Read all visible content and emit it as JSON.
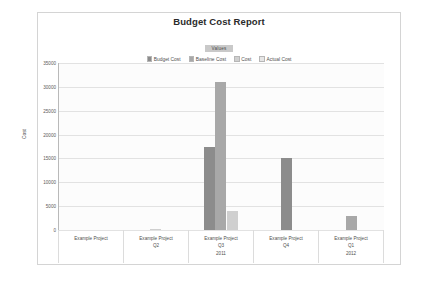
{
  "chart_data": {
    "type": "bar",
    "title": "Budget Cost Report",
    "xlabel": "",
    "ylabel": "Cost",
    "ylim": [
      0,
      35000
    ],
    "yticks": [
      "0",
      "5000",
      "10000",
      "15000",
      "20000",
      "25000",
      "30000",
      "35000"
    ],
    "grid": true,
    "legend_position": "top",
    "legend_header": "Values",
    "categories": [
      {
        "name": "Example Project",
        "quarter": "",
        "year": ""
      },
      {
        "name": "Example Project",
        "quarter": "Q2",
        "year": ""
      },
      {
        "name": "Example Project",
        "quarter": "Q3",
        "year": "2011"
      },
      {
        "name": "Example Project",
        "quarter": "Q4",
        "year": ""
      },
      {
        "name": "Example Project",
        "quarter": "Q1",
        "year": "2012"
      }
    ],
    "series": [
      {
        "name": "Budget Cost",
        "color": "#8c8c8c",
        "values": [
          0,
          0,
          17500,
          15000,
          0
        ]
      },
      {
        "name": "Baseline Cost",
        "color": "#a8a8a8",
        "values": [
          0,
          0,
          31000,
          0,
          3000
        ]
      },
      {
        "name": "Cost",
        "color": "#cfcfcf",
        "values": [
          0,
          180,
          4000,
          0,
          0
        ]
      },
      {
        "name": "Actual Cost",
        "color": "#e6e6e6",
        "values": [
          0,
          0,
          0,
          0,
          0
        ]
      }
    ]
  }
}
